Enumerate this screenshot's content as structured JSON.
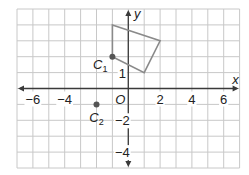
{
  "grid": {
    "x_min": -7,
    "x_max": 7,
    "y_min": -5,
    "y_max": 5,
    "grid_color": "#c8c8c8",
    "axis_color": "#3a3a3a"
  },
  "axes": {
    "x_label": "x",
    "y_label": "y",
    "origin_label": "O",
    "x_ticks": [
      {
        "v": -6,
        "t": "−6"
      },
      {
        "v": -4,
        "t": "−4"
      },
      {
        "v": 2,
        "t": "2"
      },
      {
        "v": 4,
        "t": "4"
      },
      {
        "v": 6,
        "t": "6"
      }
    ],
    "y_ticks": [
      {
        "v": 1,
        "t": "1"
      },
      {
        "v": -2,
        "t": "−2"
      },
      {
        "v": -4,
        "t": "−4"
      }
    ]
  },
  "quadrilateral": {
    "vertices": [
      [
        -1,
        4
      ],
      [
        2,
        3
      ],
      [
        1,
        1
      ],
      [
        -1,
        2
      ]
    ],
    "stroke": "#8a8a8a"
  },
  "points": [
    {
      "name": "C",
      "sub": "1",
      "x": -1,
      "y": 2
    },
    {
      "name": "C",
      "sub": "2",
      "x": -2,
      "y": -1
    }
  ],
  "point_color": "#555555"
}
